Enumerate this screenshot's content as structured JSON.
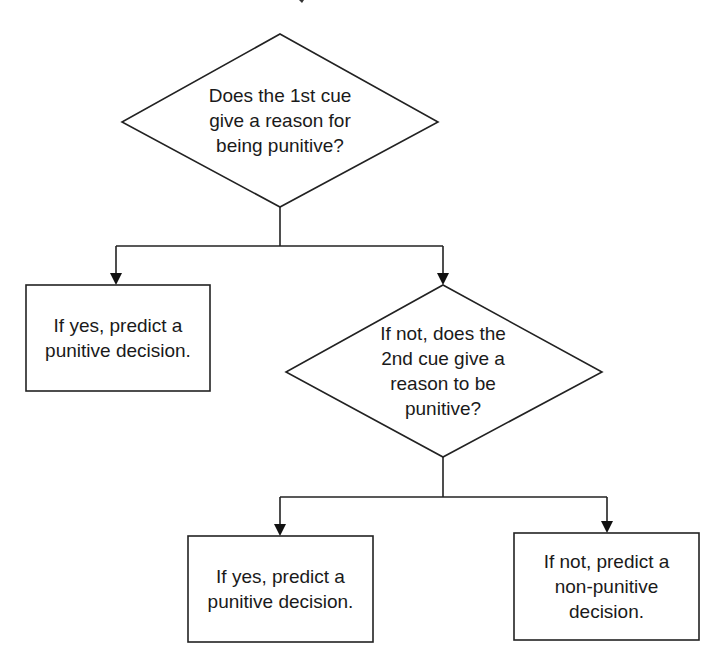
{
  "diagram": {
    "type": "flowchart",
    "nodes": [
      {
        "id": "q1",
        "shape": "diamond",
        "text": "Does the 1st cue\ngive a reason for\nbeing punitive?"
      },
      {
        "id": "r1",
        "shape": "rectangle",
        "text": "If yes, predict a\npunitive decision."
      },
      {
        "id": "q2",
        "shape": "diamond",
        "text": "If not, does the\n2nd cue give a\nreason to be\npunitive?"
      },
      {
        "id": "r2",
        "shape": "rectangle",
        "text": "If yes, predict a\npunitive decision."
      },
      {
        "id": "r3",
        "shape": "rectangle",
        "text": "If not, predict a\nnon-punitive\ndecision."
      }
    ],
    "edges": [
      {
        "from": "q1",
        "to": "r1"
      },
      {
        "from": "q1",
        "to": "q2"
      },
      {
        "from": "q2",
        "to": "r2"
      },
      {
        "from": "q2",
        "to": "r3"
      }
    ],
    "colors": {
      "line": "#222222",
      "background": "#ffffff",
      "text": "#1a1a1a"
    }
  }
}
